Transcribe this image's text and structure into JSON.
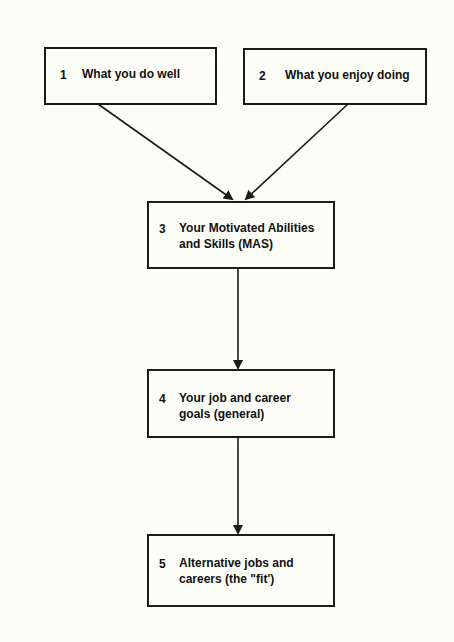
{
  "diagram": {
    "type": "flowchart",
    "header_partially_visible": true,
    "nodes": [
      {
        "id": 1,
        "number": "1",
        "label": "What you do well"
      },
      {
        "id": 2,
        "number": "2",
        "label": "What you enjoy doing"
      },
      {
        "id": 3,
        "number": "3",
        "label_line1": "Your Motivated Abilities",
        "label_line2": "and Skills (MAS)"
      },
      {
        "id": 4,
        "number": "4",
        "label_line1": "Your job and career",
        "label_line2": "goals (general)"
      },
      {
        "id": 5,
        "number": "5",
        "label_line1": "Alternative jobs and",
        "label_line2": "careers (the \"fit')"
      }
    ],
    "edges": [
      {
        "from": 1,
        "to": 3
      },
      {
        "from": 2,
        "to": 3
      },
      {
        "from": 3,
        "to": 4
      },
      {
        "from": 4,
        "to": 5
      }
    ],
    "colors": {
      "line": "#1a1a1a",
      "background": "#fdfdf8"
    }
  }
}
